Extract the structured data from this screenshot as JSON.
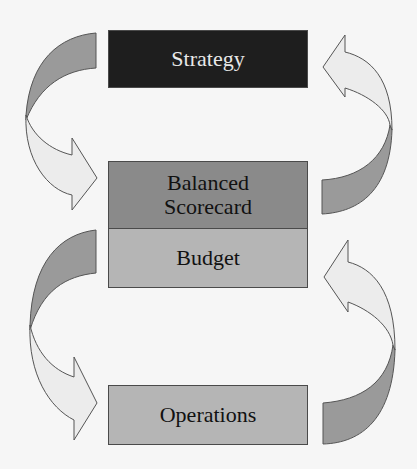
{
  "diagram": {
    "type": "management-cycle",
    "boxes": [
      {
        "id": "strategy",
        "label": "Strategy",
        "fill": "#1e1e1e",
        "text_color": "#e8e8e8"
      },
      {
        "id": "balanced-scorecard",
        "label_lines": [
          "Balanced",
          "Scorecard"
        ],
        "fill": "#8a8a8a",
        "text_color": "#111111"
      },
      {
        "id": "budget",
        "label": "Budget",
        "fill": "#b5b5b5",
        "text_color": "#111111"
      },
      {
        "id": "operations",
        "label": "Operations",
        "fill": "#b5b5b5",
        "text_color": "#111111"
      }
    ],
    "arrows": [
      {
        "id": "left-top",
        "from": "strategy",
        "to": "balanced-scorecard",
        "side": "left",
        "direction": "down"
      },
      {
        "id": "left-bottom",
        "from": "budget",
        "to": "operations",
        "side": "left",
        "direction": "down"
      },
      {
        "id": "right-top",
        "from": "balanced-scorecard",
        "to": "strategy",
        "side": "right",
        "direction": "up"
      },
      {
        "id": "right-bottom",
        "from": "operations",
        "to": "budget",
        "side": "right",
        "direction": "up"
      }
    ],
    "colors": {
      "background": "#f6f6f6",
      "arrow_dark": "#9a9a9a",
      "arrow_light": "#ececec",
      "outline": "#4a4a4a"
    }
  }
}
